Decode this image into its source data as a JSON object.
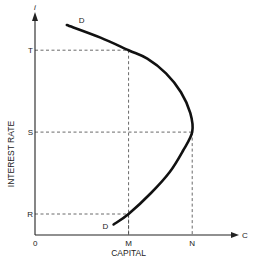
{
  "chart_data": {
    "type": "line",
    "title": "",
    "xlabel": "CAPITAL",
    "ylabel": "INTEREST RATE",
    "x_axis_symbol": "C",
    "y_axis_symbol": "i",
    "origin_label": "0",
    "grid": false,
    "x_ticks": [
      {
        "label": "M",
        "value": 0.5
      },
      {
        "label": "N",
        "value": 0.84
      }
    ],
    "y_ticks": [
      {
        "label": "R",
        "value": 0.1
      },
      {
        "label": "S",
        "value": 0.49
      },
      {
        "label": "T",
        "value": 0.88
      }
    ],
    "xlim": [
      0,
      1
    ],
    "ylim": [
      0,
      1
    ],
    "series": [
      {
        "name": "D",
        "curve_labels": [
          "D",
          "D"
        ],
        "points": [
          {
            "x": 0.42,
            "y": 0.05
          },
          {
            "x": 0.5,
            "y": 0.1
          },
          {
            "x": 0.62,
            "y": 0.2
          },
          {
            "x": 0.72,
            "y": 0.3
          },
          {
            "x": 0.79,
            "y": 0.4
          },
          {
            "x": 0.84,
            "y": 0.49
          },
          {
            "x": 0.83,
            "y": 0.58
          },
          {
            "x": 0.78,
            "y": 0.68
          },
          {
            "x": 0.7,
            "y": 0.77
          },
          {
            "x": 0.6,
            "y": 0.84
          },
          {
            "x": 0.5,
            "y": 0.88
          },
          {
            "x": 0.35,
            "y": 0.94
          },
          {
            "x": 0.17,
            "y": 1.0
          }
        ]
      }
    ],
    "guides": [
      {
        "from_tick": "T",
        "to_tick": "M"
      },
      {
        "from_tick": "S",
        "to_tick": "N"
      },
      {
        "from_tick": "R",
        "to_tick": "M"
      }
    ]
  }
}
